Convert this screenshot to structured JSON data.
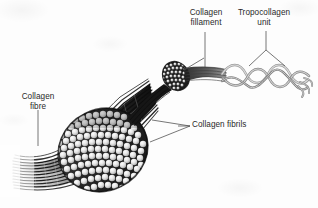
{
  "figure": {
    "background_color": "#fdfdfd",
    "text_color": "#2a2a2a",
    "ink_color": "#1a1a1a",
    "helix_color": "#8d8d8d"
  },
  "labels": {
    "filament": {
      "line1": "Collagen",
      "line2": "fillament"
    },
    "tropocollagen": {
      "line1": "Tropocollagen",
      "line2": "unit"
    },
    "fibre": {
      "line1": "Collagen",
      "line2": "fibre"
    },
    "fibrils": {
      "text": "Collagen fibrils"
    }
  },
  "structures": [
    {
      "name": "collagen-fibre-bundle",
      "description": "fan of dark striated strands fading to the left"
    },
    {
      "name": "collagen-fibril-cross-section",
      "description": "large tilted ellipse packed with light circular fibril cross-sections"
    },
    {
      "name": "collagen-filament-cross-section",
      "description": "small dark circle packed with tiny filament dots"
    },
    {
      "name": "tropocollagen-triple-helix",
      "description": "three intertwined strands forming a triple helix with splayed ends"
    }
  ]
}
